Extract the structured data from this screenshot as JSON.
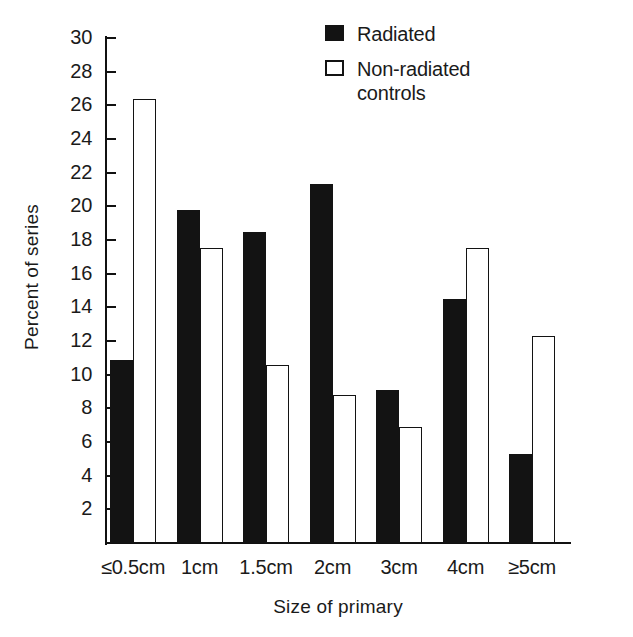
{
  "chart_data": {
    "type": "bar",
    "title": "",
    "subtitle": "",
    "xlabel": "Size of primary",
    "ylabel": "Percent of series",
    "categories": [
      "≤0.5cm",
      "1cm",
      "1.5cm",
      "2cm",
      "3cm",
      "4cm",
      "≥5cm"
    ],
    "series": [
      {
        "name": "Radiated",
        "values": [
          10.9,
          19.8,
          18.5,
          21.3,
          9.1,
          14.5,
          5.3
        ],
        "fill": "#131313",
        "style": "solid-black"
      },
      {
        "name": "Non-radiated\ncontrols",
        "values": [
          26.4,
          17.5,
          10.6,
          8.8,
          6.9,
          17.5,
          12.3
        ],
        "fill": "#ffffff",
        "style": "white-outlined"
      }
    ],
    "ylim": [
      0,
      30
    ],
    "ytick_step": 2,
    "yticks": [
      30,
      28,
      26,
      24,
      22,
      20,
      18,
      16,
      14,
      12,
      10,
      8,
      6,
      4,
      2
    ],
    "ytick_labels": [
      "30",
      "28",
      "26",
      "24",
      "22",
      "20",
      "18",
      "16",
      "14",
      "12",
      "10",
      "8",
      "6",
      "4",
      "2"
    ],
    "grid": false,
    "legend_position": "top-right",
    "orientation": "vertical",
    "bar_grouping": "grouped"
  },
  "axes": {
    "y_title": "Percent of series",
    "x_title": "Size of primary"
  },
  "legend": {
    "items": [
      {
        "label": "Radiated",
        "swatch": "filled-square-swatch"
      },
      {
        "label": "Non-radiated\ncontrols",
        "swatch": "hollow-square-swatch"
      }
    ]
  },
  "colors": {
    "ink": "#131313",
    "background": "#ffffff"
  }
}
